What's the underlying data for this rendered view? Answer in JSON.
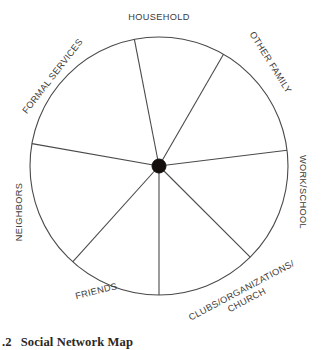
{
  "figure": {
    "caption_number": ".2",
    "caption_title": "Social Network Map",
    "background_color": "#ffffff",
    "line_color": "#4a4a4a",
    "hub_color": "#140f0c",
    "label_color": "#3d3a38"
  },
  "diagram": {
    "type": "radial-sector-wheel",
    "center_x": 159,
    "center_y": 166,
    "radius": 129,
    "hub_radius": 7,
    "sector_count": 7,
    "boundary_angles_deg": [
      60,
      101,
      170,
      228,
      270,
      315,
      7
    ]
  },
  "sectors": [
    {
      "id": "household",
      "label": "HOUSEHOLD",
      "label_x": 159,
      "label_y": 20,
      "rotation": 0,
      "anchor": "middle",
      "lines": [
        "HOUSEHOLD"
      ]
    },
    {
      "id": "other-family",
      "label": "OTHER FAMILY",
      "label_x": 268,
      "label_y": 64,
      "rotation": 58,
      "anchor": "middle",
      "lines": [
        "OTHER FAMILY"
      ]
    },
    {
      "id": "work-school",
      "label": "WORK/SCHOOL",
      "label_x": 300,
      "label_y": 192,
      "rotation": 90,
      "anchor": "middle",
      "lines": [
        "WORK/SCHOOL"
      ]
    },
    {
      "id": "clubs-organizations-church",
      "label": "CLUBS/ORGANIZATIONS/ CHURCH",
      "label_x": 243,
      "label_y": 293,
      "rotation": -28,
      "anchor": "middle",
      "lines": [
        "CLUBS/ORGANIZATIONS/",
        "CHURCH"
      ]
    },
    {
      "id": "friends",
      "label": "FRIENDS",
      "label_x": 97,
      "label_y": 294,
      "rotation": -14,
      "anchor": "middle",
      "lines": [
        "FRIENDS"
      ]
    },
    {
      "id": "neighbors",
      "label": "NEIGHBORS",
      "label_x": 22,
      "label_y": 212,
      "rotation": -90,
      "anchor": "middle",
      "lines": [
        "NEIGHBORS"
      ]
    },
    {
      "id": "formal-services",
      "label": "FORMAL SERVICES",
      "label_x": 55,
      "label_y": 78,
      "rotation": -52,
      "anchor": "middle",
      "lines": [
        "FORMAL SERVICES"
      ]
    }
  ]
}
